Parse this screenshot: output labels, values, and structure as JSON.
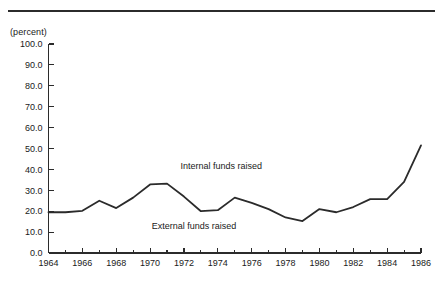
{
  "figure": {
    "unit_label": "(percent)",
    "has_top_rule": true,
    "line_color": "#2b2b2b",
    "axis_color": "#2b2b2b",
    "background": "#ffffff"
  },
  "chart_data": {
    "type": "line",
    "title": "",
    "subtitle": "",
    "xlabel": "",
    "ylabel": "(percent)",
    "ylim": [
      0.0,
      100.0
    ],
    "xlim": [
      1964,
      1986
    ],
    "grid": false,
    "legend_position": "inline-annotations",
    "y_ticks": [
      0.0,
      10.0,
      20.0,
      30.0,
      40.0,
      50.0,
      60.0,
      70.0,
      80.0,
      90.0,
      100.0
    ],
    "y_tick_labels": [
      "0.0",
      "10.0",
      "20.0",
      "30.0",
      "40.0",
      "50.0",
      "60.0",
      "70.0",
      "80.0",
      "90.0",
      "100.0"
    ],
    "x_ticks_major": [
      1964,
      1966,
      1968,
      1970,
      1972,
      1974,
      1976,
      1978,
      1980,
      1982,
      1984,
      1986
    ],
    "x_tick_labels": [
      "1964",
      "1966",
      "1968",
      "1970",
      "1972",
      "1974",
      "1976",
      "1978",
      "1980",
      "1982",
      "1984",
      "1986"
    ],
    "x_ticks_minor": [
      1965,
      1967,
      1969,
      1971,
      1973,
      1975,
      1977,
      1979,
      1981,
      1983,
      1985
    ],
    "x": [
      1964,
      1965,
      1966,
      1967,
      1968,
      1969,
      1970,
      1971,
      1972,
      1973,
      1974,
      1975,
      1976,
      1977,
      1978,
      1979,
      1980,
      1981,
      1982,
      1983,
      1984,
      1985,
      1986
    ],
    "series": [
      {
        "name": "External funds raised",
        "values": [
          19.5,
          19.5,
          20.2,
          25.0,
          21.5,
          26.5,
          32.8,
          33.2,
          27.0,
          20.0,
          20.5,
          26.5,
          24.0,
          21.0,
          17.0,
          15.3,
          21.0,
          19.5,
          22.0,
          25.8,
          25.8,
          34.0,
          51.5
        ]
      }
    ],
    "annotations": [
      {
        "text": "Internal funds raised",
        "x": 1974.2,
        "y": 40.0
      },
      {
        "text": "External funds raised",
        "x": 1972.6,
        "y": 11.5
      }
    ]
  }
}
